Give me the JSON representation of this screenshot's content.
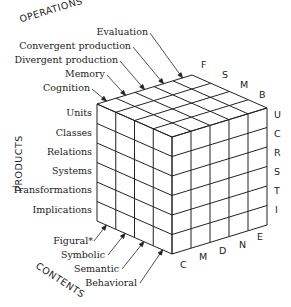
{
  "axes": {
    "operations": "OPERATIONS",
    "products": "PRODUCTS",
    "contents": "CONTENTS"
  },
  "operations": [
    {
      "label": "Evaluation",
      "code": "E"
    },
    {
      "label": "Convergent production",
      "code": "N"
    },
    {
      "label": "Divergent production",
      "code": "D"
    },
    {
      "label": "Memory",
      "code": "M"
    },
    {
      "label": "Cognition",
      "code": "C"
    }
  ],
  "products": [
    {
      "label": "Units",
      "code": "U"
    },
    {
      "label": "Classes",
      "code": "C"
    },
    {
      "label": "Relations",
      "code": "R"
    },
    {
      "label": "Systems",
      "code": "S"
    },
    {
      "label": "Transformations",
      "code": "T"
    },
    {
      "label": "Implications",
      "code": "I"
    }
  ],
  "contents": [
    {
      "label": "Figural*",
      "code": "F"
    },
    {
      "label": "Symbolic",
      "code": "S"
    },
    {
      "label": "Semantic",
      "code": "M"
    },
    {
      "label": "Behavioral",
      "code": "B"
    }
  ],
  "bottom_codes": [
    "C",
    "M",
    "D",
    "N",
    "E"
  ],
  "top_codes": [
    "F",
    "S",
    "M",
    "B"
  ],
  "right_codes": [
    "U",
    "C",
    "R",
    "S",
    "T",
    "I"
  ]
}
